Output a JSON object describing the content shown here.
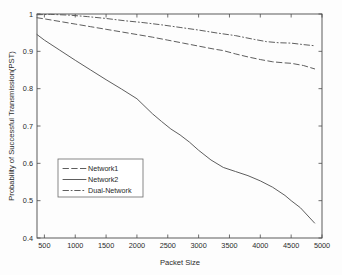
{
  "chart_data": {
    "type": "line",
    "title": "",
    "xlabel": "Packet Size",
    "ylabel": "Probability of Successful Transmission(PST)",
    "xlim": [
      380,
      5000
    ],
    "ylim": [
      0.4,
      1.0
    ],
    "xticks": [
      500,
      1000,
      1500,
      2000,
      2500,
      3000,
      3500,
      4000,
      4500,
      5000
    ],
    "xticklabels": [
      "500",
      "1000",
      "1500",
      "2000",
      "2500",
      "3000",
      "3500",
      "4000",
      "4500",
      "5000"
    ],
    "yticks": [
      0.4,
      0.5,
      0.6,
      0.7,
      0.8,
      0.9,
      1.0
    ],
    "yticklabels": [
      "0.4",
      "0.5",
      "0.6",
      "0.7",
      "0.8",
      "0.9",
      "1"
    ],
    "grid": false,
    "legend_position": "center-left",
    "line_color": "#555555",
    "series": [
      {
        "name": "Network1",
        "style": "dashed",
        "x": [
          380,
          500,
          750,
          1000,
          1250,
          1500,
          1750,
          2000,
          2250,
          2500,
          2750,
          3000,
          3250,
          3400,
          3600,
          3800,
          4000,
          4200,
          4400,
          4500,
          4700,
          4880
        ],
        "values": [
          0.99,
          0.987,
          0.98,
          0.973,
          0.966,
          0.959,
          0.952,
          0.945,
          0.938,
          0.93,
          0.922,
          0.914,
          0.906,
          0.902,
          0.893,
          0.885,
          0.878,
          0.872,
          0.869,
          0.868,
          0.862,
          0.853
        ]
      },
      {
        "name": "Network2",
        "style": "solid",
        "x": [
          380,
          500,
          750,
          1000,
          1250,
          1500,
          1750,
          2000,
          2250,
          2400,
          2550,
          2700,
          2850,
          3000,
          3200,
          3400,
          3600,
          3800,
          4000,
          4200,
          4400,
          4500,
          4650,
          4880
        ],
        "values": [
          0.945,
          0.93,
          0.903,
          0.876,
          0.85,
          0.824,
          0.799,
          0.773,
          0.733,
          0.712,
          0.692,
          0.676,
          0.657,
          0.635,
          0.609,
          0.589,
          0.578,
          0.567,
          0.553,
          0.536,
          0.514,
          0.5,
          0.481,
          0.44
        ]
      },
      {
        "name": "Dual-Network",
        "style": "dashdot",
        "x": [
          380,
          600,
          900,
          1200,
          1500,
          1800,
          2100,
          2400,
          2700,
          3000,
          3300,
          3600,
          3900,
          4100,
          4300,
          4500,
          4700,
          4880
        ],
        "values": [
          0.998,
          0.999,
          0.997,
          0.993,
          0.988,
          0.982,
          0.977,
          0.971,
          0.964,
          0.957,
          0.949,
          0.942,
          0.932,
          0.926,
          0.923,
          0.922,
          0.918,
          0.915
        ]
      }
    ]
  },
  "legend": {
    "items": [
      {
        "label": "Network1",
        "style": "dashed"
      },
      {
        "label": "Network2",
        "style": "solid"
      },
      {
        "label": "Dual-Network",
        "style": "dashdot"
      }
    ]
  }
}
